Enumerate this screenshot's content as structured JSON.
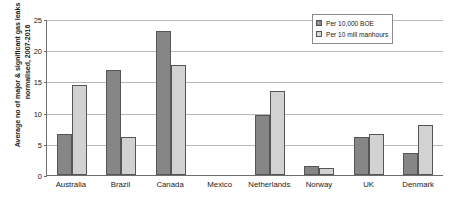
{
  "chart_data": {
    "type": "bar",
    "title": "",
    "xlabel": "",
    "ylabel": "Average no of major & significant gas leaks normalised, 2007-2016",
    "ylabel_line1": "Average no of major & significant gas leaks",
    "ylabel_line2": "normalised, 2007-2016",
    "categories": [
      "Australia",
      "Brazil",
      "Canada",
      "Mexico",
      "Netherlands",
      "Norway",
      "UK",
      "Denmark"
    ],
    "series": [
      {
        "name": "Per 10,000 BOE",
        "color": "#868686",
        "values": [
          6.5,
          16.9,
          23.1,
          0,
          9.6,
          1.5,
          6.1,
          3.6
        ]
      },
      {
        "name": "Per 10 mill manhours",
        "color": "#d2d2d2",
        "values": [
          14.5,
          6.1,
          17.6,
          0,
          13.5,
          1.2,
          6.5,
          8.0
        ]
      }
    ],
    "ylim": [
      0,
      25
    ],
    "yticks": [
      0,
      5,
      10,
      15,
      20,
      25
    ],
    "ytick_labels": [
      "0",
      "5",
      "10",
      "15",
      "20",
      "25"
    ],
    "grid": true,
    "legend_position": "top-right",
    "gridline_color": "#b9b9b9",
    "axis_color": "#6e6e6e"
  }
}
